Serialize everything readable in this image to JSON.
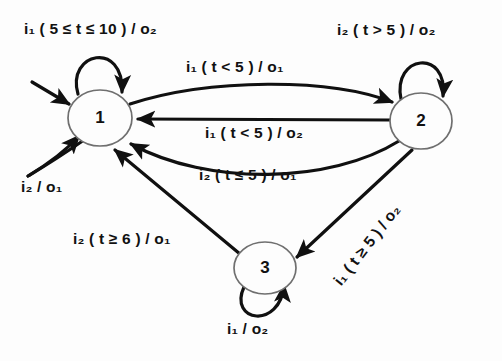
{
  "figure": {
    "title": "Timed finite state machine state transition diagram",
    "background_color": "#fdfdfd",
    "line_color": "#101010",
    "node_stroke_color": "#6f6f6f",
    "node_fill_color": "#fdfdfd"
  },
  "states": [
    {
      "id": "1",
      "label": "1",
      "cx": 100,
      "cy": 118,
      "rx": 32,
      "ry": 28,
      "initial": true
    },
    {
      "id": "2",
      "label": "2",
      "cx": 421,
      "cy": 121,
      "rx": 31,
      "ry": 28,
      "initial": false
    },
    {
      "id": "3",
      "label": "3",
      "cx": 265,
      "cy": 268,
      "rx": 31,
      "ry": 26,
      "initial": false
    }
  ],
  "transitions": [
    {
      "name": "self-loop-state-1-top",
      "from": "1",
      "to": "1",
      "input": "i1",
      "guard": "5 <= t <= 10",
      "output": "o2",
      "label_text": "i₁ ( 5 ≤ t ≤ 10 ) / o₂",
      "label_x": 24,
      "label_y": 20,
      "rotation": 0
    },
    {
      "name": "self-loop-state-2-top",
      "from": "2",
      "to": "2",
      "input": "i2",
      "guard": "t > 5",
      "output": "o2",
      "label_text": "i₂ ( t > 5 ) / o₂",
      "label_x": 337,
      "label_y": 21,
      "rotation": 0
    },
    {
      "name": "transition-1-to-2",
      "from": "1",
      "to": "2",
      "input": "i1",
      "guard": "t < 5",
      "output": "o1",
      "label_text": "i₁ ( t < 5 ) / o₁",
      "label_x": 186,
      "label_y": 58,
      "rotation": 0
    },
    {
      "name": "transition-2-to-1-straight",
      "from": "2",
      "to": "1",
      "input": "i1",
      "guard": "t < 5",
      "output": "o2",
      "label_text": "i₁ ( t < 5 ) / o₂",
      "label_x": 205,
      "label_y": 124,
      "rotation": 0
    },
    {
      "name": "transition-2-to-1-curved",
      "from": "2",
      "to": "1",
      "input": "i2",
      "guard": "t <= 5",
      "output": "o1",
      "label_text": "i₂ ( t ≤ 5 ) / o₁",
      "label_x": 199,
      "label_y": 166,
      "rotation": 0
    },
    {
      "name": "self-loop-state-1-bottom-left",
      "from": "1",
      "to": "1",
      "input": "i2",
      "guard": "",
      "output": "o1",
      "label_text": "i₂ / o₁",
      "label_x": 21,
      "label_y": 178,
      "rotation": 0
    },
    {
      "name": "transition-3-to-1",
      "from": "3",
      "to": "1",
      "input": "i2",
      "guard": "t >= 6",
      "output": "o1",
      "label_text": "i₂ ( t ≥ 6 ) / o₁",
      "label_x": 73,
      "label_y": 230,
      "rotation": 0
    },
    {
      "name": "transition-2-to-3",
      "from": "2",
      "to": "3",
      "input": "i1",
      "guard": "t >= 5",
      "output": "o2",
      "label_text": "i₁ ( t ≥ 5 ) / o₂",
      "label_x": 330,
      "label_y": 278,
      "rotation": -52
    },
    {
      "name": "self-loop-state-3-bottom",
      "from": "3",
      "to": "3",
      "input": "i1",
      "guard": "",
      "output": "o2",
      "label_text": "i₁ / o₂",
      "label_x": 227,
      "label_y": 320,
      "rotation": 0
    }
  ]
}
